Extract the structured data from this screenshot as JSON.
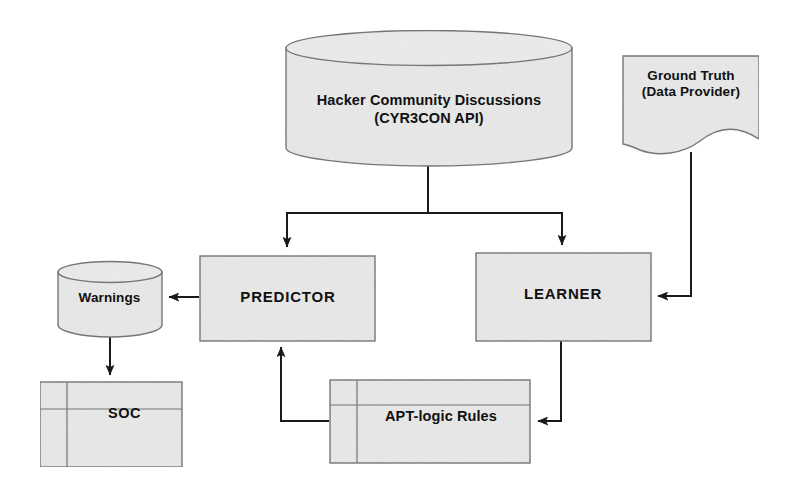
{
  "diagram": {
    "background_color": "#ffffff",
    "node_fill_color": "#e9e9e9",
    "node_stroke_color": "#6e6e6e",
    "connector_color": "#1a1a1a",
    "text_color": "#111111",
    "nodes": [
      {
        "id": "hacker-community",
        "shape": "cylinder",
        "line1": "Hacker Community Discussions",
        "line2": "(CYR3CON API)"
      },
      {
        "id": "ground-truth",
        "shape": "document",
        "line1": "Ground Truth",
        "line2": "(Data Provider)"
      },
      {
        "id": "predictor",
        "shape": "rectangle",
        "label": "PREDICTOR"
      },
      {
        "id": "learner",
        "shape": "rectangle",
        "label": "LEARNER"
      },
      {
        "id": "warnings",
        "shape": "cylinder",
        "label": "Warnings"
      },
      {
        "id": "soc",
        "shape": "partitioned-box",
        "label": "SOC"
      },
      {
        "id": "apt-rules",
        "shape": "partitioned-box",
        "label": "APT-logic Rules"
      }
    ],
    "edges": [
      {
        "id": "hacker-to-predictor",
        "from": "hacker-community",
        "to": "predictor",
        "arrow": "end"
      },
      {
        "id": "hacker-to-learner",
        "from": "hacker-community",
        "to": "learner",
        "arrow": "end"
      },
      {
        "id": "groundtruth-to-learner",
        "from": "ground-truth",
        "to": "learner",
        "arrow": "end"
      },
      {
        "id": "learner-to-apt-rules",
        "from": "learner",
        "to": "apt-rules",
        "arrow": "end"
      },
      {
        "id": "apt-rules-to-predictor",
        "from": "apt-rules",
        "to": "predictor",
        "arrow": "end"
      },
      {
        "id": "predictor-to-warnings",
        "from": "predictor",
        "to": "warnings",
        "arrow": "end"
      },
      {
        "id": "warnings-to-soc",
        "from": "warnings",
        "to": "soc",
        "arrow": "end"
      }
    ]
  }
}
